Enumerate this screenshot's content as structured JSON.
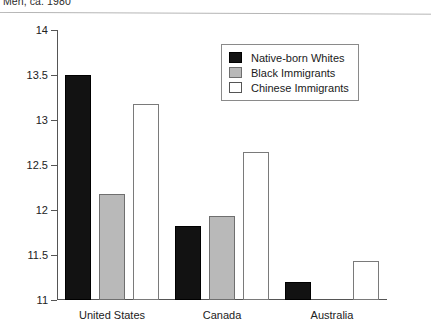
{
  "caption": "Men, ca. 1980",
  "legend": {
    "position": "inside-top-right",
    "entries": [
      {
        "label": "Native-born Whites",
        "swatch": "black",
        "color": "#121212"
      },
      {
        "label": "Black Immigrants",
        "swatch": "gray",
        "color": "#b9b9b9"
      },
      {
        "label": "Chinese Immigrants",
        "swatch": "white",
        "color": "#ffffff"
      }
    ]
  },
  "chart_data": {
    "type": "bar",
    "title": "Men, ca. 1980",
    "xlabel": "",
    "ylabel": "",
    "ylim": [
      11,
      14
    ],
    "yticks": [
      11,
      11.5,
      12,
      12.5,
      13,
      13.5,
      14
    ],
    "ytick_labels": [
      "11",
      "11.5",
      "12",
      "12.5",
      "13",
      "13.5",
      "14"
    ],
    "grid": false,
    "legend_position": "inside-top-right",
    "categories": [
      "United States",
      "Canada",
      "Australia"
    ],
    "series": [
      {
        "name": "Native-born Whites",
        "color": "#121212",
        "values": [
          13.5,
          11.82,
          11.2
        ]
      },
      {
        "name": "Black Immigrants",
        "color": "#b9b9b9",
        "values": [
          12.18,
          11.93,
          null
        ]
      },
      {
        "name": "Chinese Immigrants",
        "color": "#ffffff",
        "values": [
          13.18,
          12.65,
          11.43
        ]
      }
    ]
  }
}
